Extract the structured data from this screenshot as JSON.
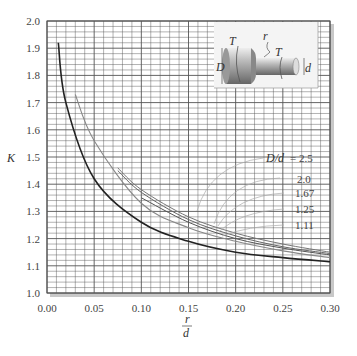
{
  "chart_data": {
    "type": "line",
    "title": "",
    "xlabel": "r/d",
    "ylabel": "K",
    "xlim": [
      0.0,
      0.3
    ],
    "ylim": [
      1.0,
      2.0
    ],
    "grid": true,
    "x_ticks": [
      "0.00",
      "0.05",
      "0.10",
      "0.15",
      "0.20",
      "0.25",
      "0.30"
    ],
    "y_ticks": [
      "1.0",
      "1.1",
      "1.2",
      "1.3",
      "1.4",
      "1.5",
      "1.6",
      "1.7",
      "1.8",
      "1.9",
      "2.0"
    ],
    "legend_title": "D/d",
    "series": [
      {
        "name": "D/d = 2.5",
        "label": "= 2.5",
        "x": [
          0.075,
          0.1,
          0.15,
          0.2,
          0.25,
          0.3
        ],
        "y": [
          1.46,
          1.38,
          1.28,
          1.22,
          1.18,
          1.15
        ]
      },
      {
        "name": "D/d = 2.0",
        "label": "2.0",
        "x": [
          0.075,
          0.1,
          0.15,
          0.2,
          0.25,
          0.3
        ],
        "y": [
          1.45,
          1.37,
          1.27,
          1.21,
          1.17,
          1.145
        ]
      },
      {
        "name": "D/d = 1.67",
        "label": "1.67",
        "x": [
          0.1,
          0.15,
          0.2,
          0.25,
          0.3
        ],
        "y": [
          1.35,
          1.26,
          1.2,
          1.165,
          1.14
        ]
      },
      {
        "name": "D/d = 1.25",
        "label": "1.25",
        "x": [
          0.03,
          0.05,
          0.1,
          0.15,
          0.2,
          0.25,
          0.3
        ],
        "y": [
          1.73,
          1.56,
          1.33,
          1.24,
          1.19,
          1.155,
          1.13
        ]
      },
      {
        "name": "D/d = 1.11",
        "label": "1.11",
        "x": [
          0.012,
          0.02,
          0.05,
          0.1,
          0.15,
          0.2,
          0.25,
          0.3
        ],
        "y": [
          1.92,
          1.7,
          1.42,
          1.26,
          1.19,
          1.15,
          1.13,
          1.115
        ]
      }
    ],
    "annotations": [
      "D/d = 2.5",
      "2.0",
      "1.67",
      "1.25",
      "1.11"
    ],
    "inset": {
      "labels": [
        "T",
        "r",
        "T",
        "D",
        "d"
      ],
      "description": "stepped shaft with shoulder fillet under torsion"
    }
  },
  "inset_labels": {
    "t1": "T",
    "r": "r",
    "t2": "T",
    "D": "D",
    "d": "d"
  },
  "axis": {
    "ylabel": "K",
    "xlabel_num": "r",
    "xlabel_den": "d"
  },
  "legend": {
    "title": "D/d",
    "items": [
      "= 2.5",
      "2.0",
      "1.67",
      "1.25",
      "1.11"
    ]
  },
  "colors": {
    "grid": "#555555",
    "curve_dark": "#222222",
    "curve_light": "#999999",
    "frame_shadow": "#bbbbbb"
  }
}
